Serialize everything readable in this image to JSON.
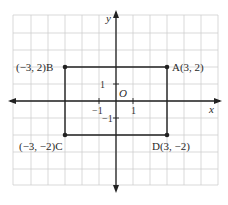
{
  "diagram": {
    "type": "coordinate-plane",
    "axes": {
      "x_label": "x",
      "y_label": "y",
      "origin_label": "O",
      "tick_labels": {
        "x_neg": "−1",
        "x_pos": "1",
        "y_pos": "1",
        "y_neg": "−1"
      }
    },
    "grid": {
      "columns": 12,
      "rows": 10,
      "color": "#cccccc"
    },
    "rectangle": {
      "stroke": "#222222",
      "points": [
        {
          "name": "A",
          "label": "A(3, 2)",
          "x": 3,
          "y": 2
        },
        {
          "name": "B",
          "label": "(−3, 2)B",
          "x": -3,
          "y": 2
        },
        {
          "name": "C",
          "label": "(−3, −2)C",
          "x": -3,
          "y": -2
        },
        {
          "name": "D",
          "label": "D(3, −2)",
          "x": 3,
          "y": -2
        }
      ]
    }
  }
}
